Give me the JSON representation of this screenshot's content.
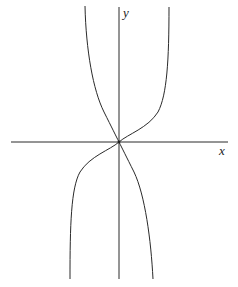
{
  "diagram": {
    "type": "function-graph",
    "axes": {
      "x_label": "x",
      "y_label": "y",
      "origin": [
        119,
        142
      ]
    },
    "curves": [
      {
        "name": "increasing-curve",
        "description": "increasing curve through origin with vertical asymptote behaviour, rising steeply to the upper right and falling steeply to the lower left"
      },
      {
        "name": "decreasing-curve",
        "description": "decreasing curve through origin, falling from upper left to lower right"
      }
    ],
    "colors": {
      "line": "#2a2a2a",
      "background": "#ffffff"
    }
  }
}
